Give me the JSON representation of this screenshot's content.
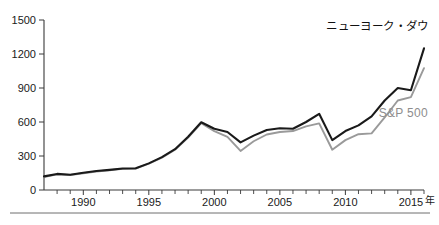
{
  "chart_data": {
    "type": "line",
    "title": "",
    "xlabel": "年",
    "ylabel": "",
    "ylim": [
      0,
      1500
    ],
    "xlim": [
      1987,
      2016
    ],
    "grid": false,
    "legend_position": "inline-annotation",
    "yticks": [
      0,
      300,
      600,
      900,
      1200,
      1500
    ],
    "ytick_labels": [
      "0",
      "300",
      "600",
      "900",
      "1200",
      "1500"
    ],
    "xticks": [
      1990,
      1995,
      2000,
      2005,
      2010,
      2015
    ],
    "xtick_labels": [
      "1990",
      "1995",
      "2000",
      "2005",
      "2010",
      "2015"
    ],
    "xtick_minor_interval": 1,
    "x": [
      1987,
      1988,
      1989,
      1990,
      1991,
      1992,
      1993,
      1994,
      1995,
      1996,
      1997,
      1998,
      1999,
      2000,
      2001,
      2002,
      2003,
      2004,
      2005,
      2006,
      2007,
      2008,
      2009,
      2010,
      2011,
      2012,
      2013,
      2014,
      2015,
      2016
    ],
    "series": [
      {
        "name": "ニューヨーク・ダウ",
        "color": "#1a1a1a",
        "label_x": 2015,
        "label_y": 1410,
        "values": [
          120,
          142,
          135,
          152,
          168,
          178,
          190,
          192,
          235,
          290,
          360,
          470,
          598,
          540,
          512,
          420,
          480,
          530,
          545,
          540,
          600,
          672,
          440,
          520,
          570,
          650,
          790,
          900,
          880,
          1250
        ]
      },
      {
        "name": "S&P 500",
        "color": "#9a9a9a",
        "label_x": 2013,
        "label_y": 640,
        "values": [
          115,
          138,
          132,
          148,
          163,
          174,
          186,
          188,
          232,
          286,
          355,
          462,
          590,
          520,
          468,
          345,
          430,
          490,
          512,
          520,
          562,
          588,
          355,
          440,
          492,
          500,
          640,
          790,
          820,
          1075
        ]
      }
    ],
    "annotations": [
      {
        "text": "ニューヨーク・ダウ",
        "series": "dow"
      },
      {
        "text": "S&P 500",
        "series": "sp500"
      }
    ]
  },
  "axis": {
    "unit_label": "年",
    "zero_label": "0"
  },
  "colors": {
    "dow_line": "#1a1a1a",
    "sp_line": "#9a9a9a",
    "axis": "#3a3a3a",
    "footer_rule": "#6f6f6f",
    "background": "#ffffff"
  }
}
